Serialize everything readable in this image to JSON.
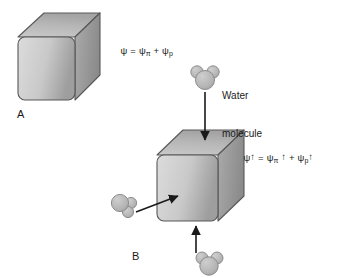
{
  "figure": {
    "background_color": "#ffffff",
    "width": 343,
    "height": 278
  },
  "colors": {
    "cube_front_light": "#d2d2d2",
    "cube_front_dark": "#9c9c9c",
    "cube_top_light": "#c4c4c4",
    "cube_top_dark": "#a8a8a8",
    "cube_side_light": "#a5a5a5",
    "cube_side_dark": "#8a8a8a",
    "cube_outline": "#58585a",
    "molecule_fill": "#b5b5b5",
    "molecule_outline": "#8e8e8e",
    "arrow_color": "#1a1a1a",
    "text_color": "#1a1a1a"
  },
  "panels": [
    {
      "id": "A",
      "label": "A",
      "formula": {
        "lhs": "ψ",
        "equals": "=",
        "term1_symbol": "ψ",
        "term1_sub": "π",
        "plus": "+",
        "term2_symbol": "ψ",
        "term2_sub": "p",
        "full_text": "ψ = ψπ + ψp"
      },
      "cube": {
        "label": "cell-cube-a"
      }
    },
    {
      "id": "B",
      "label": "B",
      "formula": {
        "lhs": "ψ",
        "lhs_arrow": "↑",
        "equals": "=",
        "term1_symbol": "ψ",
        "term1_sub": "π",
        "term1_arrow": "↑",
        "plus": "+",
        "term2_symbol": "ψ",
        "term2_sub": "p",
        "term2_arrow": "↑",
        "full_text": "ψ↑ = ψπ ↑ + ψp↑"
      },
      "cube": {
        "label": "cell-cube-b"
      }
    }
  ],
  "callouts": [
    {
      "id": "water-molecule",
      "line1": "Water",
      "line2": "molecule"
    }
  ],
  "molecules": [
    {
      "id": "molecule-top",
      "orientation": "bumps-up"
    },
    {
      "id": "molecule-left",
      "orientation": "bumps-right"
    },
    {
      "id": "molecule-bottom",
      "orientation": "bumps-up"
    }
  ],
  "arrows": [
    {
      "id": "arrow-top-into-cube",
      "direction": "down"
    },
    {
      "id": "arrow-left-into-cube",
      "direction": "right-up"
    },
    {
      "id": "arrow-bottom-into-cube",
      "direction": "up"
    }
  ]
}
